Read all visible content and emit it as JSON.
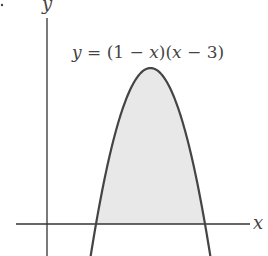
{
  "chart_data": {
    "type": "area",
    "title": "",
    "equation_label": "y = (1 − x)(x − 3)",
    "xlabel": "x",
    "ylabel": "y",
    "function": "(1 - x)(x - 3)",
    "roots": [
      1,
      3
    ],
    "vertex": {
      "x": 2,
      "y": 1
    },
    "shaded_region": {
      "from_x": 1,
      "to_x": 3,
      "description": "area between curve and x-axis"
    },
    "x": [
      0.9,
      1.0,
      1.25,
      1.5,
      1.75,
      2.0,
      2.25,
      2.5,
      2.75,
      3.0,
      3.1
    ],
    "values": [
      -0.21,
      0,
      0.4375,
      0.75,
      0.9375,
      1.0,
      0.9375,
      0.75,
      0.4375,
      0,
      -0.21
    ],
    "grid": false,
    "legend": null,
    "colors": {
      "curve": "#444444",
      "fill": "#e6e6e6",
      "axes": "#333333"
    }
  },
  "labels": {
    "x_axis": "x",
    "y_axis": "y",
    "equation_parts": [
      "y = (1 − ",
      "x",
      ")(",
      "x",
      " − 3)"
    ]
  }
}
